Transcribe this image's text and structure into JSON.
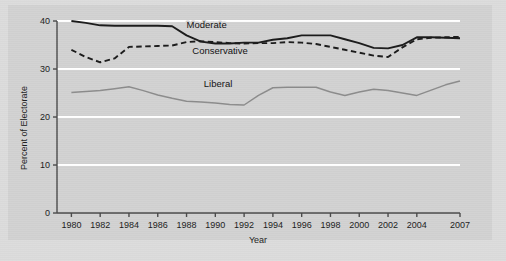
{
  "chart_data": {
    "type": "line",
    "title": "",
    "xlabel": "Year",
    "ylabel": "Percent of Electorate",
    "xlim": [
      1979,
      2007
    ],
    "ylim": [
      0,
      40
    ],
    "grid": true,
    "grid_orientation": "horizontal",
    "legend_position": "inline-labels",
    "y_ticks": [
      0,
      10,
      20,
      30,
      40
    ],
    "y_tick_labels": [
      "0",
      "10",
      "20",
      "30",
      "40"
    ],
    "x_ticks": [
      1980,
      1982,
      1984,
      1986,
      1988,
      1990,
      1992,
      1994,
      1996,
      1998,
      2000,
      2002,
      2004,
      2007
    ],
    "x_tick_labels": [
      "1980",
      "1982",
      "1984",
      "1986",
      "1988",
      "1990",
      "1992",
      "1994",
      "1996",
      "1998",
      "2000",
      "2002",
      "2004",
      "2007"
    ],
    "x": [
      1980,
      1981,
      1982,
      1983,
      1984,
      1985,
      1986,
      1987,
      1988,
      1989,
      1990,
      1991,
      1992,
      1993,
      1994,
      1995,
      1996,
      1997,
      1998,
      1999,
      2000,
      2001,
      2002,
      2003,
      2004,
      2005,
      2006,
      2007
    ],
    "series": [
      {
        "name": "Moderate",
        "style": "solid",
        "color": "#1a1a1a",
        "label_x": 1988,
        "label_y": 38.6,
        "values": [
          40.0,
          39.6,
          39.1,
          39.0,
          39.0,
          39.0,
          39.0,
          38.9,
          37.0,
          35.7,
          35.3,
          35.3,
          35.5,
          35.5,
          36.1,
          36.4,
          37.0,
          37.0,
          37.0,
          36.2,
          35.4,
          34.4,
          34.3,
          35.0,
          36.6,
          36.6,
          36.5,
          36.4
        ]
      },
      {
        "name": "Conservative",
        "style": "dashed",
        "color": "#1a1a1a",
        "label_x": 1988.4,
        "label_y": 33.2,
        "values": [
          34.0,
          32.5,
          31.4,
          32.2,
          34.6,
          34.7,
          34.8,
          34.9,
          35.6,
          35.8,
          35.6,
          35.4,
          35.3,
          35.4,
          35.4,
          35.6,
          35.5,
          35.2,
          34.6,
          34.0,
          33.4,
          32.8,
          32.5,
          34.5,
          36.2,
          36.5,
          36.6,
          36.7
        ]
      },
      {
        "name": "Liberal",
        "style": "solid",
        "color": "#8c8c8c",
        "label_x": 1989.2,
        "label_y": 26.2,
        "values": [
          25.1,
          25.3,
          25.5,
          25.9,
          26.3,
          25.5,
          24.6,
          23.9,
          23.3,
          23.1,
          22.9,
          22.6,
          22.5,
          24.5,
          26.1,
          26.2,
          26.2,
          26.2,
          25.2,
          24.5,
          25.2,
          25.8,
          25.5,
          25.0,
          24.5,
          25.6,
          26.7,
          27.5
        ]
      }
    ]
  },
  "labels": {
    "y_axis_title": "Percent of Electorate",
    "x_axis_title": "Year",
    "series_moderate": "Moderate",
    "series_conservative": "Conservative",
    "series_liberal": "Liberal"
  },
  "colors": {
    "figure_background": "#dcdcdc",
    "panel_background": "#d2d2d2",
    "gridline": "#ffffff",
    "axis": "#4a4a4a",
    "moderate": "#1a1a1a",
    "conservative": "#1a1a1a",
    "liberal": "#8c8c8c",
    "text": "#1b1b1b"
  }
}
